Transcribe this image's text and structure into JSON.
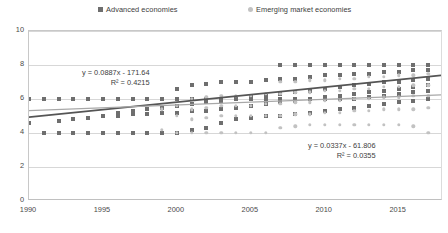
{
  "legend": {
    "entries": [
      {
        "label": "Advanced economies",
        "color": "#6e6e6e",
        "marker": "square-marker"
      },
      {
        "label": "Emerging market economies",
        "color": "#c2c2c2",
        "marker": "circle-marker"
      }
    ]
  },
  "annotations": {
    "advanced": {
      "equation": "y = 0.0887x - 171.64",
      "r_squared": "R² = 0.4215"
    },
    "emerging": {
      "equation": "y = 0.0337x - 61.806",
      "r_squared": "R² = 0.0355"
    }
  },
  "chart_data": {
    "type": "scatter",
    "title": "",
    "xlabel": "",
    "ylabel": "",
    "xlim": [
      1990,
      2018
    ],
    "ylim": [
      0,
      10
    ],
    "xticks": [
      1990,
      1995,
      2000,
      2005,
      2010,
      2015
    ],
    "yticks": [
      0,
      2,
      4,
      6,
      8,
      10
    ],
    "grid": true,
    "legend_position": "top",
    "series": [
      {
        "name": "Advanced economies",
        "color": "#6e6e6e",
        "marker": "square",
        "trendline": {
          "equation": "y = 0.0887x - 171.64",
          "slope": 0.0887,
          "intercept": -171.64,
          "r_squared": 0.4215,
          "color": "#555555"
        },
        "points": [
          [
            1990,
            6.0
          ],
          [
            1990,
            4.6
          ],
          [
            1991,
            6.0
          ],
          [
            1991,
            4.0
          ],
          [
            1992,
            6.0
          ],
          [
            1992,
            4.0
          ],
          [
            1992,
            4.7
          ],
          [
            1993,
            6.0
          ],
          [
            1993,
            4.0
          ],
          [
            1993,
            4.8
          ],
          [
            1994,
            6.0
          ],
          [
            1994,
            4.0
          ],
          [
            1994,
            4.9
          ],
          [
            1995,
            6.0
          ],
          [
            1995,
            4.0
          ],
          [
            1995,
            5.0
          ],
          [
            1996,
            6.0
          ],
          [
            1996,
            4.0
          ],
          [
            1996,
            5.0
          ],
          [
            1996,
            5.2
          ],
          [
            1997,
            6.0
          ],
          [
            1997,
            4.0
          ],
          [
            1997,
            5.1
          ],
          [
            1997,
            5.3
          ],
          [
            1998,
            6.0
          ],
          [
            1998,
            4.0
          ],
          [
            1998,
            5.1
          ],
          [
            1998,
            5.4
          ],
          [
            1999,
            6.0
          ],
          [
            1999,
            4.0
          ],
          [
            1999,
            5.2
          ],
          [
            1999,
            5.5
          ],
          [
            2000,
            6.0
          ],
          [
            2000,
            4.0
          ],
          [
            2000,
            5.2
          ],
          [
            2000,
            5.6
          ],
          [
            2000,
            6.6
          ],
          [
            2001,
            6.0
          ],
          [
            2001,
            4.2
          ],
          [
            2001,
            5.3
          ],
          [
            2001,
            5.7
          ],
          [
            2001,
            6.8
          ],
          [
            2002,
            6.0
          ],
          [
            2002,
            4.3
          ],
          [
            2002,
            5.3
          ],
          [
            2002,
            5.8
          ],
          [
            2002,
            6.9
          ],
          [
            2003,
            6.0
          ],
          [
            2003,
            4.6
          ],
          [
            2003,
            5.4
          ],
          [
            2003,
            5.9
          ],
          [
            2003,
            7.0
          ],
          [
            2004,
            6.0
          ],
          [
            2004,
            4.8
          ],
          [
            2004,
            5.5
          ],
          [
            2004,
            6.0
          ],
          [
            2004,
            7.0
          ],
          [
            2005,
            6.0
          ],
          [
            2005,
            4.9
          ],
          [
            2005,
            5.6
          ],
          [
            2005,
            6.1
          ],
          [
            2005,
            7.0
          ],
          [
            2006,
            6.0
          ],
          [
            2006,
            5.0
          ],
          [
            2006,
            5.7
          ],
          [
            2006,
            6.2
          ],
          [
            2006,
            7.1
          ],
          [
            2007,
            6.0
          ],
          [
            2007,
            5.0
          ],
          [
            2007,
            5.8
          ],
          [
            2007,
            6.3
          ],
          [
            2007,
            7.2
          ],
          [
            2007,
            8.0
          ],
          [
            2008,
            6.0
          ],
          [
            2008,
            5.1
          ],
          [
            2008,
            5.9
          ],
          [
            2008,
            6.4
          ],
          [
            2008,
            7.2
          ],
          [
            2008,
            8.0
          ],
          [
            2009,
            6.0
          ],
          [
            2009,
            5.2
          ],
          [
            2009,
            6.0
          ],
          [
            2009,
            6.5
          ],
          [
            2009,
            7.3
          ],
          [
            2009,
            8.0
          ],
          [
            2010,
            6.0
          ],
          [
            2010,
            5.3
          ],
          [
            2010,
            6.1
          ],
          [
            2010,
            6.6
          ],
          [
            2010,
            7.4
          ],
          [
            2010,
            8.0
          ],
          [
            2011,
            6.0
          ],
          [
            2011,
            5.4
          ],
          [
            2011,
            6.2
          ],
          [
            2011,
            6.7
          ],
          [
            2011,
            7.4
          ],
          [
            2011,
            8.0
          ],
          [
            2012,
            6.0
          ],
          [
            2012,
            5.5
          ],
          [
            2012,
            6.3
          ],
          [
            2012,
            6.8
          ],
          [
            2012,
            7.5
          ],
          [
            2012,
            8.0
          ],
          [
            2013,
            6.1
          ],
          [
            2013,
            5.6
          ],
          [
            2013,
            6.4
          ],
          [
            2013,
            6.9
          ],
          [
            2013,
            7.5
          ],
          [
            2013,
            8.0
          ],
          [
            2014,
            6.2
          ],
          [
            2014,
            5.7
          ],
          [
            2014,
            6.5
          ],
          [
            2014,
            7.0
          ],
          [
            2014,
            7.6
          ],
          [
            2014,
            8.0
          ],
          [
            2015,
            6.3
          ],
          [
            2015,
            5.8
          ],
          [
            2015,
            6.6
          ],
          [
            2015,
            7.0
          ],
          [
            2015,
            7.6
          ],
          [
            2015,
            8.0
          ],
          [
            2016,
            6.4
          ],
          [
            2016,
            5.9
          ],
          [
            2016,
            6.7
          ],
          [
            2016,
            7.1
          ],
          [
            2016,
            7.7
          ],
          [
            2016,
            8.0
          ],
          [
            2017,
            6.5
          ],
          [
            2017,
            6.0
          ],
          [
            2017,
            6.8
          ],
          [
            2017,
            7.2
          ],
          [
            2017,
            7.7
          ],
          [
            2017,
            8.0
          ]
        ]
      },
      {
        "name": "Emerging market economies",
        "color": "#c2c2c2",
        "marker": "circle",
        "trendline": {
          "equation": "y = 0.0337x - 61.806",
          "slope": 0.0337,
          "intercept": -61.806,
          "r_squared": 0.0355,
          "color": "#a8a8a8"
        },
        "points": [
          [
            1999,
            4.2
          ],
          [
            1999,
            5.4
          ],
          [
            2000,
            4.0
          ],
          [
            2000,
            5.0
          ],
          [
            2000,
            5.6
          ],
          [
            2001,
            4.0
          ],
          [
            2001,
            4.8
          ],
          [
            2001,
            5.4
          ],
          [
            2001,
            6.0
          ],
          [
            2002,
            4.0
          ],
          [
            2002,
            4.9
          ],
          [
            2002,
            5.5
          ],
          [
            2002,
            6.1
          ],
          [
            2003,
            4.0
          ],
          [
            2003,
            5.0
          ],
          [
            2003,
            5.6
          ],
          [
            2003,
            6.2
          ],
          [
            2004,
            4.0
          ],
          [
            2004,
            5.0
          ],
          [
            2004,
            5.6
          ],
          [
            2004,
            6.2
          ],
          [
            2005,
            4.0
          ],
          [
            2005,
            5.0
          ],
          [
            2005,
            5.6
          ],
          [
            2005,
            6.2
          ],
          [
            2006,
            4.0
          ],
          [
            2006,
            5.0
          ],
          [
            2006,
            5.7
          ],
          [
            2006,
            6.3
          ],
          [
            2007,
            4.3
          ],
          [
            2007,
            5.0
          ],
          [
            2007,
            5.7
          ],
          [
            2007,
            6.3
          ],
          [
            2007,
            7.0
          ],
          [
            2008,
            4.4
          ],
          [
            2008,
            5.1
          ],
          [
            2008,
            5.8
          ],
          [
            2008,
            6.4
          ],
          [
            2008,
            7.0
          ],
          [
            2009,
            4.5
          ],
          [
            2009,
            5.1
          ],
          [
            2009,
            5.8
          ],
          [
            2009,
            6.4
          ],
          [
            2009,
            7.1
          ],
          [
            2010,
            4.5
          ],
          [
            2010,
            5.2
          ],
          [
            2010,
            5.9
          ],
          [
            2010,
            6.5
          ],
          [
            2010,
            7.1
          ],
          [
            2011,
            4.5
          ],
          [
            2011,
            5.2
          ],
          [
            2011,
            5.9
          ],
          [
            2011,
            6.5
          ],
          [
            2011,
            7.2
          ],
          [
            2012,
            4.5
          ],
          [
            2012,
            5.3
          ],
          [
            2012,
            6.0
          ],
          [
            2012,
            6.6
          ],
          [
            2012,
            7.2
          ],
          [
            2013,
            4.5
          ],
          [
            2013,
            5.3
          ],
          [
            2013,
            6.0
          ],
          [
            2013,
            6.6
          ],
          [
            2013,
            7.3
          ],
          [
            2014,
            4.5
          ],
          [
            2014,
            5.4
          ],
          [
            2014,
            6.1
          ],
          [
            2014,
            6.7
          ],
          [
            2014,
            7.3
          ],
          [
            2015,
            4.5
          ],
          [
            2015,
            5.4
          ],
          [
            2015,
            6.1
          ],
          [
            2015,
            6.7
          ],
          [
            2015,
            7.4
          ],
          [
            2016,
            4.4
          ],
          [
            2016,
            5.4
          ],
          [
            2016,
            6.2
          ],
          [
            2016,
            6.8
          ],
          [
            2016,
            7.4
          ],
          [
            2017,
            4.0
          ],
          [
            2017,
            5.5
          ],
          [
            2017,
            6.2
          ],
          [
            2017,
            6.8
          ],
          [
            2017,
            7.5
          ]
        ]
      }
    ]
  }
}
